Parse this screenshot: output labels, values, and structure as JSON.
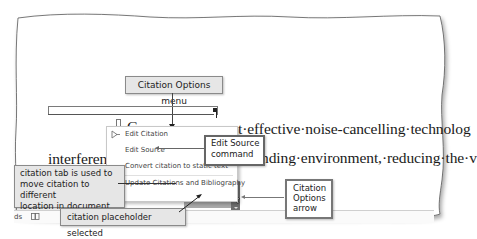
{
  "document": {
    "line1": "Gupta and Raley state that effective noise-cancelling technolog",
    "line1_prefix": "·G",
    "line2_left": "interferenc",
    "line2_right": "nding·environment,·reducing·the·v",
    "line3": "nd·earbuds·(Gupta).",
    "pilcrow": "¶"
  },
  "citation_placeholder": {
    "text": "(Gupta)"
  },
  "context_menu": {
    "items": [
      {
        "label": "Edit Citation",
        "icon": "edit-citation-icon"
      },
      {
        "label": "Edit Source"
      },
      {
        "label": "Convert citation to static text"
      },
      {
        "label": "Update Citations and Bibliography"
      }
    ]
  },
  "callouts": {
    "citation_options_menu": "Citation Options menu",
    "edit_source_command": [
      "Edit Source",
      "command"
    ],
    "citation_tab": [
      "citation tab is used to",
      "move citation to different",
      "location in document"
    ],
    "citation_options_arrow": [
      "Citation",
      "Options",
      "arrow"
    ],
    "placeholder_selected": "citation placeholder selected"
  },
  "status_bar": {
    "left_text": "ds",
    "icon": "book-icon"
  }
}
